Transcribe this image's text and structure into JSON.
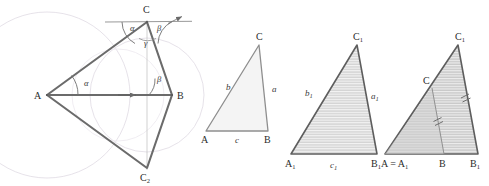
{
  "figure": {
    "type": "geometry-diagram",
    "background": "#ffffff",
    "colors": {
      "stroke_dark": "#595959",
      "stroke_mid": "#7a7a7a",
      "circle_light": "#e2dfe6",
      "fill_light": "#f2f2f2",
      "fill_gray": "#d9d9d9",
      "hatch": "#ffffff",
      "text": "#2b2b2b"
    }
  },
  "panels": [
    {
      "id": "panel-construction",
      "name": "construction-with-circles",
      "labels": {
        "vertex_a": "A",
        "vertex_b": "B",
        "vertex_c": "C",
        "vertex_c2": "C",
        "vertex_c2_sub": "2",
        "angle_alpha_at_a": "α",
        "angle_beta_at_b": "β",
        "angle_alpha_at_c": "α",
        "angle_beta_at_c": "β",
        "angle_gamma_at_c": "γ"
      },
      "elements": [
        "large-circle-centered-A",
        "small-circle-centered-B",
        "horizontal-line-through-C-with-arrow",
        "triangle-ABC",
        "triangle-ABC2",
        "vertical-axis-C-to-C2",
        "angle-arc-alpha-A",
        "angle-arc-beta-B",
        "angle-arc-alpha-C",
        "angle-arc-beta-C",
        "angle-arc-gamma-C",
        "direction-arrow-on-AB"
      ]
    },
    {
      "id": "panel-triangle-abc",
      "name": "reference-triangle-ABC",
      "labels": {
        "vertex_a": "A",
        "vertex_b": "B",
        "vertex_c": "C",
        "side_a": "a",
        "side_b": "b",
        "side_c": "c"
      },
      "fill": "light"
    },
    {
      "id": "panel-triangle-a1b1c1",
      "name": "congruent-triangle-A1B1C1",
      "labels": {
        "vertex_a1": "A",
        "vertex_a1_sub": "1",
        "vertex_b1": "B",
        "vertex_b1_sub": "1",
        "vertex_c1": "C",
        "vertex_c1_sub": "1",
        "side_a1": "a",
        "side_a1_sub": "1",
        "side_b1": "b",
        "side_b1_sub": "1",
        "side_c1": "c",
        "side_c1_sub": "1"
      },
      "fill": "hatched"
    },
    {
      "id": "panel-superimposed",
      "name": "superimposed-triangles",
      "labels": {
        "vertex_a_eq_a1": "A = A",
        "vertex_a_eq_a1_sub": "1",
        "vertex_b": "B",
        "vertex_b1": "B",
        "vertex_b1_sub": "1",
        "vertex_c": "C",
        "vertex_c1": "C",
        "vertex_c1_sub": "1"
      },
      "fill": "hatched",
      "tick_marks": "double-parallel-ticks-on-CB-and-C1B1"
    }
  ]
}
